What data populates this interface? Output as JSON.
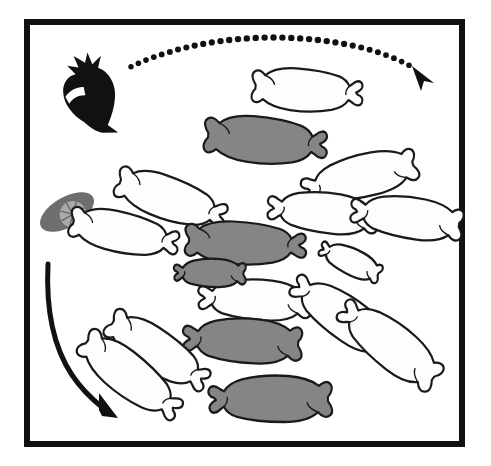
{
  "figure": {
    "title": "Circular group of seals with predator and prey",
    "caption": "",
    "background_color": "#ffffff"
  },
  "frame": {
    "name": "figure-border",
    "stroke_color": "#111111",
    "stroke_width": 6,
    "x": 27,
    "y": 22,
    "width": 435,
    "height": 422
  },
  "palette": {
    "outline": "#1a1a1a",
    "seal_white_fill": "#fdfdfd",
    "seal_gray_fill": "#858585",
    "predator_black": "#111111",
    "prey_gray": "#6e6e6e",
    "prey_disc_gray": "#a9a9a9",
    "arrow_black": "#111111"
  },
  "arrows": [
    {
      "name": "dotted-arc-arrow",
      "style": "dotted",
      "label": "",
      "color": "#111111",
      "direction": "left-to-right",
      "dot_count": 40,
      "dot_radius": 3.2,
      "start": [
        130,
        68
      ],
      "end": [
        420,
        74
      ],
      "peak": [
        278,
        30
      ]
    },
    {
      "name": "solid-curved-arrow",
      "style": "solid",
      "label": "",
      "color": "#111111",
      "direction": "downward-right",
      "stroke_width": 5,
      "start": [
        48,
        264
      ],
      "end": [
        110,
        415
      ]
    }
  ],
  "organisms": {
    "predator": {
      "name": "black-penguin-predator",
      "fill": "#111111",
      "position": [
        84,
        105
      ],
      "rotation": 35,
      "count": 1
    },
    "prey": {
      "name": "gray-disc-prey",
      "fill": "#6e6e6e",
      "disc_fill": "#a9a9a9",
      "spokes": 8,
      "position": [
        67,
        212
      ],
      "rotation": -28,
      "count": 1
    }
  },
  "seals": {
    "legend": {
      "white_label": "unfilled seal outline",
      "gray_label": "gray filled seal"
    },
    "counts": {
      "white": 12,
      "gray": 5,
      "total": 17
    },
    "items": [
      {
        "id": 1,
        "fill": "white",
        "cx": 304,
        "cy": 90,
        "len": 108,
        "wid": 42,
        "rot": 4,
        "flip": 1
      },
      {
        "id": 2,
        "fill": "gray",
        "cx": 262,
        "cy": 140,
        "len": 120,
        "wid": 46,
        "rot": 5,
        "flip": 1
      },
      {
        "id": 3,
        "fill": "white",
        "cx": 168,
        "cy": 198,
        "len": 112,
        "wid": 42,
        "rot": 19,
        "flip": 1
      },
      {
        "id": 4,
        "fill": "white",
        "cx": 121,
        "cy": 232,
        "len": 108,
        "wid": 40,
        "rot": 12,
        "flip": 1
      },
      {
        "id": 5,
        "fill": "white",
        "cx": 363,
        "cy": 176,
        "len": 114,
        "wid": 42,
        "rot": 166,
        "flip": 1
      },
      {
        "id": 6,
        "fill": "white",
        "cx": 326,
        "cy": 213,
        "len": 108,
        "wid": 40,
        "rot": 186,
        "flip": 1
      },
      {
        "id": 7,
        "fill": "white",
        "cx": 410,
        "cy": 218,
        "len": 110,
        "wid": 41,
        "rot": 188,
        "flip": 1
      },
      {
        "id": 8,
        "fill": "gray",
        "cx": 242,
        "cy": 243,
        "len": 118,
        "wid": 42,
        "rot": 3,
        "flip": 1
      },
      {
        "id": 9,
        "fill": "white",
        "cx": 258,
        "cy": 300,
        "len": 110,
        "wid": 40,
        "rot": 183,
        "flip": 1
      },
      {
        "id": 10,
        "fill": "gray",
        "cx": 246,
        "cy": 341,
        "len": 116,
        "wid": 44,
        "rot": 183,
        "flip": 1
      },
      {
        "id": 11,
        "fill": "gray",
        "cx": 274,
        "cy": 399,
        "len": 120,
        "wid": 46,
        "rot": 180,
        "flip": 1
      },
      {
        "id": 12,
        "fill": "white",
        "cx": 345,
        "cy": 318,
        "len": 114,
        "wid": 42,
        "rot": 215,
        "flip": 1
      },
      {
        "id": 13,
        "fill": "white",
        "cx": 392,
        "cy": 346,
        "len": 116,
        "wid": 44,
        "rot": 218,
        "flip": 1
      },
      {
        "id": 14,
        "fill": "white",
        "cx": 155,
        "cy": 350,
        "len": 112,
        "wid": 42,
        "rot": 33,
        "flip": 1
      },
      {
        "id": 15,
        "fill": "white",
        "cx": 128,
        "cy": 374,
        "len": 116,
        "wid": 42,
        "rot": 38,
        "flip": 1
      },
      {
        "id": 16,
        "fill": "gray",
        "cx": 212,
        "cy": 273,
        "len": 70,
        "wid": 28,
        "rot": 181,
        "flip": 1
      },
      {
        "id": 17,
        "fill": "white",
        "cx": 352,
        "cy": 262,
        "len": 64,
        "wid": 26,
        "rot": 205,
        "flip": 1
      }
    ]
  }
}
